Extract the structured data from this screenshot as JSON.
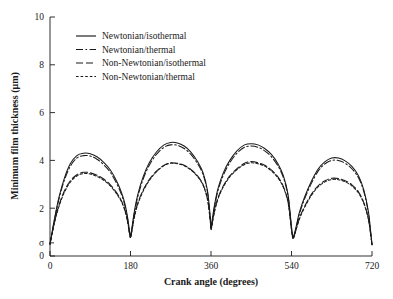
{
  "chart_data": {
    "type": "line",
    "title": "",
    "xlabel": "Crank angle (degrees)",
    "ylabel": "Minimum film thickness (μm)",
    "xlim": [
      0,
      720
    ],
    "ylim": [
      0,
      10
    ],
    "grid": false,
    "legend_position": "top-left-inside",
    "xticks": [
      0,
      180,
      360,
      540,
      720
    ],
    "xtick_labels": [
      "0",
      "180",
      "360",
      "540",
      "720"
    ],
    "yticks": [
      0,
      2,
      4,
      6,
      8,
      10
    ],
    "ytick_labels": [
      "0",
      "2",
      "4",
      "6",
      "8",
      "10"
    ],
    "annotations": [
      {
        "name": "sigma-marker",
        "text": "σ",
        "axis": "y",
        "value": 0.55
      }
    ],
    "series": [
      {
        "name": "Newtonian/isothermal",
        "style": "solid",
        "color": "#1a1a1a",
        "x": [
          0,
          10,
          20,
          32,
          45,
          60,
          75,
          90,
          105,
          120,
          135,
          150,
          160,
          168,
          174,
          178,
          180,
          183,
          188,
          196,
          208,
          222,
          238,
          255,
          270,
          285,
          300,
          315,
          330,
          342,
          352,
          358,
          360,
          363,
          368,
          376,
          388,
          402,
          418,
          435,
          450,
          465,
          480,
          495,
          510,
          522,
          532,
          538,
          541,
          544,
          550,
          558,
          570,
          585,
          600,
          615,
          630,
          645,
          660,
          675,
          690,
          702,
          712,
          718,
          720
        ],
        "y": [
          0.5,
          1.55,
          2.45,
          3.25,
          3.85,
          4.2,
          4.3,
          4.28,
          4.15,
          3.92,
          3.6,
          3.1,
          2.65,
          2.15,
          1.55,
          1.0,
          0.85,
          1.15,
          1.8,
          2.55,
          3.3,
          3.9,
          4.35,
          4.65,
          4.75,
          4.73,
          4.6,
          4.35,
          3.95,
          3.5,
          2.75,
          1.7,
          1.2,
          1.55,
          2.15,
          2.85,
          3.5,
          4.0,
          4.4,
          4.65,
          4.7,
          4.65,
          4.5,
          4.25,
          3.85,
          3.35,
          2.6,
          1.6,
          1.05,
          0.8,
          1.2,
          1.85,
          2.5,
          3.15,
          3.65,
          3.95,
          4.1,
          4.1,
          3.98,
          3.75,
          3.35,
          2.75,
          1.85,
          0.85,
          0.5
        ]
      },
      {
        "name": "Newtonian/thermal",
        "style": "dashdot",
        "color": "#1a1a1a",
        "x": [
          0,
          10,
          20,
          32,
          45,
          60,
          75,
          90,
          105,
          120,
          135,
          150,
          160,
          168,
          174,
          178,
          180,
          183,
          188,
          196,
          208,
          222,
          238,
          255,
          270,
          285,
          300,
          315,
          330,
          342,
          352,
          358,
          360,
          363,
          368,
          376,
          388,
          402,
          418,
          435,
          450,
          465,
          480,
          495,
          510,
          522,
          532,
          538,
          541,
          544,
          550,
          558,
          570,
          585,
          600,
          615,
          630,
          645,
          660,
          675,
          690,
          702,
          712,
          718,
          720
        ],
        "y": [
          0.5,
          1.5,
          2.38,
          3.16,
          3.74,
          4.1,
          4.2,
          4.18,
          4.05,
          3.82,
          3.5,
          3.0,
          2.56,
          2.07,
          1.48,
          0.95,
          0.8,
          1.1,
          1.72,
          2.46,
          3.2,
          3.8,
          4.25,
          4.55,
          4.65,
          4.63,
          4.5,
          4.25,
          3.86,
          3.42,
          2.68,
          1.64,
          1.15,
          1.48,
          2.07,
          2.76,
          3.4,
          3.9,
          4.3,
          4.55,
          4.6,
          4.55,
          4.4,
          4.15,
          3.76,
          3.27,
          2.53,
          1.55,
          1.0,
          0.76,
          1.15,
          1.78,
          2.42,
          3.06,
          3.56,
          3.86,
          4.0,
          4.0,
          3.88,
          3.65,
          3.26,
          2.67,
          1.79,
          0.8,
          0.48
        ]
      },
      {
        "name": "Non-Newtonian/isothermal",
        "style": "longdash",
        "color": "#1a1a1a",
        "x": [
          0,
          10,
          20,
          32,
          45,
          60,
          75,
          90,
          105,
          120,
          135,
          150,
          160,
          168,
          174,
          178,
          180,
          183,
          188,
          196,
          208,
          222,
          238,
          255,
          270,
          285,
          300,
          315,
          330,
          342,
          352,
          358,
          360,
          363,
          368,
          376,
          388,
          402,
          418,
          435,
          450,
          465,
          480,
          495,
          510,
          522,
          532,
          538,
          541,
          544,
          550,
          558,
          570,
          585,
          600,
          615,
          630,
          645,
          660,
          675,
          690,
          702,
          712,
          718,
          720
        ],
        "y": [
          0.5,
          1.42,
          2.12,
          2.72,
          3.14,
          3.4,
          3.5,
          3.48,
          3.38,
          3.22,
          2.98,
          2.62,
          2.3,
          1.9,
          1.4,
          0.92,
          0.78,
          1.05,
          1.6,
          2.2,
          2.75,
          3.2,
          3.55,
          3.8,
          3.9,
          3.88,
          3.8,
          3.62,
          3.35,
          3.0,
          2.4,
          1.55,
          1.12,
          1.4,
          1.9,
          2.45,
          2.95,
          3.35,
          3.65,
          3.88,
          3.95,
          3.9,
          3.8,
          3.6,
          3.3,
          2.9,
          2.3,
          1.45,
          0.98,
          0.75,
          1.1,
          1.6,
          2.1,
          2.6,
          2.95,
          3.15,
          3.25,
          3.24,
          3.15,
          2.98,
          2.68,
          2.22,
          1.55,
          0.78,
          0.48
        ]
      },
      {
        "name": "Non-Newtonian/thermal",
        "style": "dotted",
        "color": "#1a1a1a",
        "x": [
          0,
          10,
          20,
          32,
          45,
          60,
          75,
          90,
          105,
          120,
          135,
          150,
          160,
          168,
          174,
          178,
          180,
          183,
          188,
          196,
          208,
          222,
          238,
          255,
          270,
          285,
          300,
          315,
          330,
          342,
          352,
          358,
          360,
          363,
          368,
          376,
          388,
          402,
          418,
          435,
          450,
          465,
          480,
          495,
          510,
          522,
          532,
          538,
          541,
          544,
          550,
          558,
          570,
          585,
          600,
          615,
          630,
          645,
          660,
          675,
          690,
          702,
          712,
          718,
          720
        ],
        "y": [
          0.5,
          1.38,
          2.07,
          2.66,
          3.08,
          3.35,
          3.45,
          3.43,
          3.33,
          3.17,
          2.93,
          2.57,
          2.26,
          1.86,
          1.37,
          0.9,
          0.76,
          1.02,
          1.56,
          2.15,
          2.7,
          3.16,
          3.52,
          3.78,
          3.88,
          3.86,
          3.78,
          3.6,
          3.32,
          2.97,
          2.37,
          1.52,
          1.1,
          1.37,
          1.86,
          2.41,
          2.91,
          3.31,
          3.61,
          3.83,
          3.9,
          3.86,
          3.76,
          3.56,
          3.26,
          2.86,
          2.26,
          1.42,
          0.95,
          0.72,
          1.07,
          1.56,
          2.06,
          2.55,
          2.9,
          3.1,
          3.2,
          3.19,
          3.1,
          2.93,
          2.63,
          2.18,
          1.52,
          0.76,
          0.46
        ]
      }
    ]
  },
  "legend": {
    "entries": [
      {
        "label": "Newtonian/isothermal"
      },
      {
        "label": "Newtonian/thermal"
      },
      {
        "label": "Non-Newtonian/isothermal"
      },
      {
        "label": "Non-Newtonian/thermal"
      }
    ]
  }
}
